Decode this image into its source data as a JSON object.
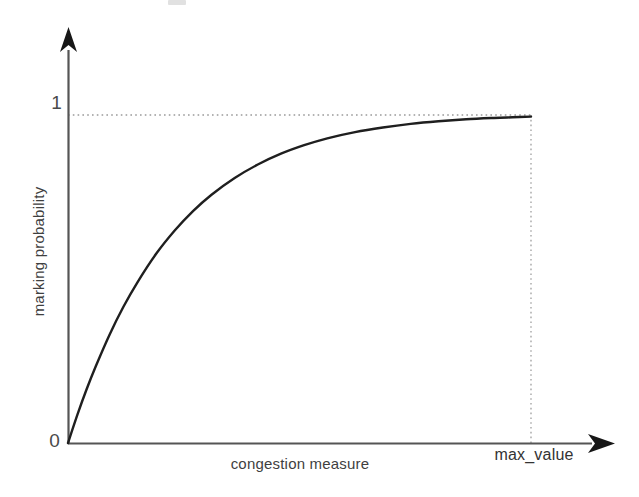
{
  "figure": {
    "background_color": "#ffffff",
    "ink_color": "#1f1f1f",
    "guide_color": "#9a9a9a",
    "axis_color": "#555555"
  },
  "labels": {
    "y_tick_1": "1",
    "y_tick_0": "0",
    "y_axis": "marking probability",
    "x_axis": "congestion measure",
    "x_max": "max_value"
  },
  "chart_data": {
    "type": "line",
    "title": "",
    "subtitle": "",
    "xlabel": "congestion measure",
    "ylabel": "marking probability",
    "xlim": [
      0,
      1
    ],
    "ylim": [
      0,
      1.05
    ],
    "grid": false,
    "legend": "none",
    "x_tick_labels": [
      "max_value"
    ],
    "x_tick_values": [
      1
    ],
    "y_tick_labels": [
      "0",
      "1"
    ],
    "y_tick_values": [
      0,
      1
    ],
    "annotations": [
      {
        "name": "asymptote-guide",
        "kind": "horizontal-dotted-line",
        "y": 1,
        "x_from": 0,
        "x_to": 1,
        "style": "dotted",
        "color": "#9a9a9a"
      },
      {
        "name": "max-value-guide",
        "kind": "vertical-dotted-line",
        "x": 1,
        "y_from": 0,
        "y_to": 1,
        "style": "dotted",
        "color": "#9a9a9a"
      }
    ],
    "series": [
      {
        "name": "marking probability",
        "color": "#1f1f1f",
        "line_width": 2.4,
        "description": "Concave saturating curve rising from the origin and flattening to 1 at max_value",
        "x": [
          0.0,
          0.02,
          0.04,
          0.06,
          0.09,
          0.12,
          0.15,
          0.19,
          0.23,
          0.27,
          0.31,
          0.36,
          0.41,
          0.46,
          0.51,
          0.56,
          0.62,
          0.68,
          0.74,
          0.8,
          0.86,
          0.92,
          0.96,
          1.0
        ],
        "y": [
          0.0,
          0.085,
          0.163,
          0.234,
          0.331,
          0.416,
          0.49,
          0.576,
          0.647,
          0.707,
          0.757,
          0.808,
          0.849,
          0.882,
          0.908,
          0.929,
          0.948,
          0.962,
          0.973,
          0.981,
          0.987,
          0.991,
          0.993,
          0.995
        ]
      }
    ]
  },
  "geometry": {
    "origin_x_px": 68,
    "origin_y_px": 443,
    "max_value_x_px": 531,
    "probability_one_y_px": 115,
    "y_axis_top_px": 50,
    "x_axis_right_px": 588
  }
}
